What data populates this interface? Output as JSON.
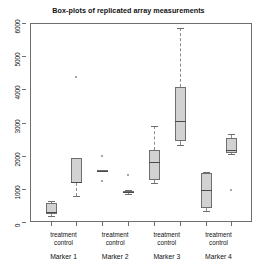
{
  "chart": {
    "title": "Box-plots of replicated array measurements",
    "y_axis": {
      "ticks": [
        "0",
        "1000",
        "2000",
        "3000",
        "4000",
        "5000",
        "6000"
      ]
    },
    "x_axis": {
      "condition_labels": [
        "treatment",
        "control"
      ],
      "group_labels": [
        "Marker 1",
        "Marker 2",
        "Marker 3",
        "Marker 4"
      ]
    }
  },
  "colors": {
    "box_fill": "#d2d2d2",
    "box_border": "#6e6e6e",
    "median": "#4a4a4a",
    "whisker": "#8a8a8a",
    "frame": "#6e6e6e",
    "background": "#ffffff",
    "text": "#111111"
  },
  "chart_data": {
    "type": "box",
    "title": "Box-plots of replicated array measurements",
    "xlabel": "",
    "ylabel": "",
    "ylim": [
      0,
      6000
    ],
    "yticks": [
      0,
      1000,
      2000,
      3000,
      4000,
      5000,
      6000
    ],
    "grid": false,
    "legend": "none",
    "categories": [
      "Marker 1",
      "Marker 2",
      "Marker 3",
      "Marker 4"
    ],
    "conditions": [
      "treatment",
      "control"
    ],
    "boxes": [
      {
        "group": "Marker 1",
        "condition": "treatment",
        "whisker_low": 180,
        "q1": 240,
        "median": 300,
        "q3": 560,
        "whisker_high": 620,
        "outliers": []
      },
      {
        "group": "Marker 1",
        "condition": "control",
        "whisker_low": 790,
        "q1": 1180,
        "median": 1200,
        "q3": 1930,
        "whisker_high": 1930,
        "outliers": [
          4380
        ]
      },
      {
        "group": "Marker 2",
        "condition": "treatment",
        "whisker_low": 1520,
        "q1": 1520,
        "median": 1550,
        "q3": 1580,
        "whisker_high": 1580,
        "outliers": [
          1980,
          1230
        ]
      },
      {
        "group": "Marker 2",
        "condition": "control",
        "whisker_low": 850,
        "q1": 870,
        "median": 900,
        "q3": 940,
        "whisker_high": 960,
        "outliers": [
          1430
        ]
      },
      {
        "group": "Marker 3",
        "condition": "treatment",
        "whisker_low": 1190,
        "q1": 1260,
        "median": 1810,
        "q3": 2160,
        "whisker_high": 2890,
        "outliers": []
      },
      {
        "group": "Marker 3",
        "condition": "control",
        "whisker_low": 2330,
        "q1": 2430,
        "median": 3050,
        "q3": 4080,
        "whisker_high": 5850,
        "outliers": []
      },
      {
        "group": "Marker 4",
        "condition": "treatment",
        "whisker_low": 340,
        "q1": 430,
        "median": 950,
        "q3": 1480,
        "whisker_high": 1500,
        "outliers": []
      },
      {
        "group": "Marker 4",
        "condition": "control",
        "whisker_low": 2050,
        "q1": 2080,
        "median": 2180,
        "q3": 2520,
        "whisker_high": 2640,
        "outliers": [
          950
        ]
      }
    ]
  }
}
